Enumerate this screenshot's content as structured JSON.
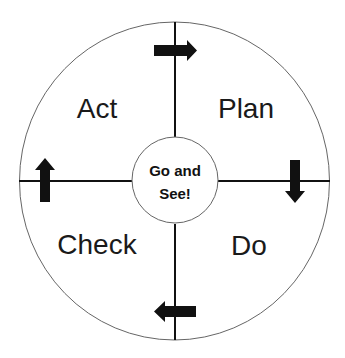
{
  "diagram": {
    "type": "PDCA cycle",
    "quadrants": {
      "top_left": "Act",
      "top_right": "Plan",
      "bottom_right": "Do",
      "bottom_left": "Check"
    },
    "center": {
      "line1": "Go and",
      "line2": "See!"
    },
    "arrows": [
      {
        "position": "top",
        "direction": "right-arrow-icon"
      },
      {
        "position": "right",
        "direction": "down-arrow-icon"
      },
      {
        "position": "bottom",
        "direction": "left-arrow-icon"
      },
      {
        "position": "left",
        "direction": "up-arrow-icon"
      }
    ],
    "colors": {
      "stroke": "#111111",
      "circle_stroke": "#555555",
      "arrow_fill": "#111111",
      "background": "#ffffff"
    }
  }
}
